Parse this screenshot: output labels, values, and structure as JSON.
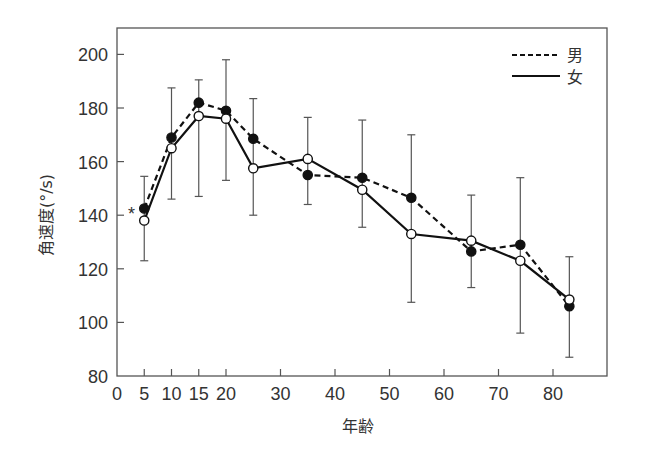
{
  "chart_data": {
    "type": "line",
    "title": "",
    "xlabel": "年齢",
    "ylabel": "角速度(°/s)",
    "xlim": [
      0,
      88
    ],
    "ylim": [
      80,
      205
    ],
    "x_ticks": [
      0,
      5,
      10,
      15,
      20,
      30,
      40,
      50,
      60,
      70,
      80
    ],
    "x_tick_labels": [
      "0",
      "5",
      "10",
      "15",
      "20",
      "30",
      "40",
      "50",
      "60",
      "70",
      "80"
    ],
    "y_ticks": [
      80,
      100,
      120,
      140,
      160,
      180,
      200
    ],
    "y_tick_labels": [
      "80",
      "100",
      "120",
      "140",
      "160",
      "180",
      "200"
    ],
    "grid": false,
    "legend_position": "upper right",
    "x": [
      5,
      10,
      15,
      20,
      25,
      35,
      45,
      54,
      65,
      74,
      83
    ],
    "series": [
      {
        "name": "男",
        "style": "dashed",
        "marker": "filled-circle",
        "values": [
          142.5,
          169,
          182,
          179,
          168.5,
          155,
          154,
          146.5,
          126.5,
          129,
          106
        ]
      },
      {
        "name": "女",
        "style": "solid",
        "marker": "open-circle",
        "values": [
          138,
          165,
          177,
          176,
          157.5,
          161,
          149.5,
          133,
          130.5,
          123,
          108.5
        ]
      }
    ],
    "error_bars": [
      {
        "x": 5,
        "low": 123,
        "high": 154.5
      },
      {
        "x": 10,
        "low": 146,
        "high": 187.5
      },
      {
        "x": 15,
        "low": 147,
        "high": 190.5
      },
      {
        "x": 20,
        "low": 153,
        "high": 198
      },
      {
        "x": 25,
        "low": 140,
        "high": 183.5
      },
      {
        "x": 35,
        "low": 144,
        "high": 176.5
      },
      {
        "x": 45,
        "low": 135.5,
        "high": 175.5
      },
      {
        "x": 54,
        "low": 107.5,
        "high": 170
      },
      {
        "x": 65,
        "low": 113,
        "high": 147.5
      },
      {
        "x": 74,
        "low": 96,
        "high": 154
      },
      {
        "x": 83,
        "low": 87,
        "high": 124.5
      }
    ],
    "annotations": [
      {
        "text": "*",
        "x": 3,
        "y": 141
      }
    ]
  },
  "legend": {
    "male_label": "男",
    "female_label": "女"
  },
  "axes": {
    "xlabel": "年齢",
    "ylabel": "角速度(°/s)"
  },
  "colors": {
    "line": "#111111",
    "axis": "#555555",
    "text": "#333333"
  }
}
